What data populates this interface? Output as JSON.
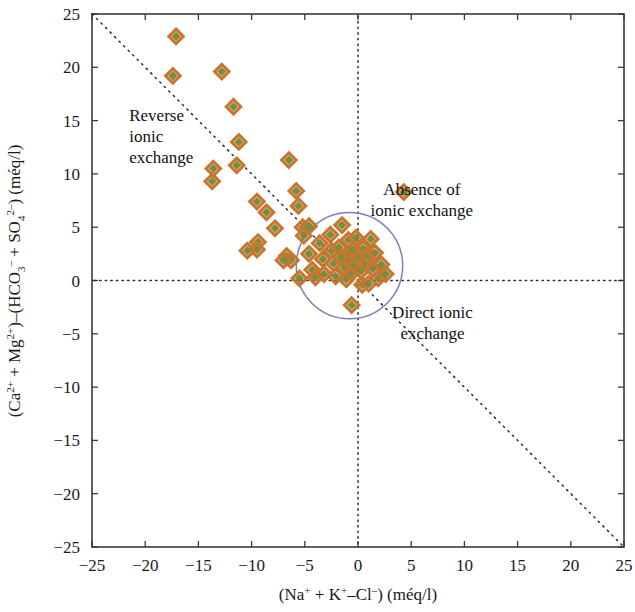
{
  "chart_data": {
    "type": "scatter",
    "title": "",
    "xlabel": "(Na+ + K+–Cl–) (méq/l)",
    "ylabel": "(Ca2+ + Mg2+)–(HCO3– + SO42–) (méq/l)",
    "xlim": [
      -25,
      25
    ],
    "ylim": [
      -25,
      25
    ],
    "xticks": [
      -25,
      -20,
      -15,
      -10,
      -5,
      0,
      5,
      10,
      15,
      20,
      25
    ],
    "yticks": [
      -25,
      -20,
      -15,
      -10,
      -5,
      0,
      5,
      10,
      15,
      20,
      25
    ],
    "xtick_labels": [
      "−25",
      "−20",
      "−15",
      "−10",
      "−5",
      "0",
      "5",
      "10",
      "15",
      "20",
      "25"
    ],
    "ytick_labels": [
      "−25",
      "−20",
      "−15",
      "−10",
      "−5",
      "0",
      "5",
      "10",
      "15",
      "20",
      "25"
    ],
    "grid": false,
    "legend": "none",
    "marker": "diamond",
    "marker_fill_color": "#7d8c3c",
    "marker_edge_color": "#c8762f",
    "reference_lines": [
      {
        "name": "horizontal-zero-line",
        "type": "horizontal",
        "value": 0,
        "style": "dotted"
      },
      {
        "name": "vertical-zero-line",
        "type": "vertical",
        "value": 0,
        "style": "dotted"
      },
      {
        "name": "one-to-one-negative-slope-line",
        "type": "diagonal",
        "slope": -1,
        "intercept": 0,
        "style": "dotted",
        "from": [
          -25,
          25
        ],
        "to": [
          25,
          -25
        ]
      }
    ],
    "regions": [
      {
        "name": "absence-of-ionic-exchange-circle",
        "type": "circle",
        "center": [
          -0.8,
          1.4
        ],
        "radius": 5.0,
        "stroke": "#7b7fb5"
      }
    ],
    "annotations": [
      {
        "name": "reverse-ionic-exchange-label",
        "lines": [
          "Reverse",
          "ionic",
          "exchange"
        ],
        "x": -21.5,
        "y": 15.0
      },
      {
        "name": "absence-of-ionic-exchange-label",
        "lines": [
          "Absence of",
          "ionic exchange"
        ],
        "x": 6.0,
        "y": 8.0
      },
      {
        "name": "direct-ionic-exchange-label",
        "lines": [
          "Direct ionic",
          "exchange"
        ],
        "x": 7.0,
        "y": -3.5
      }
    ],
    "points": [
      [
        -17.1,
        22.9
      ],
      [
        -17.4,
        19.2
      ],
      [
        -12.8,
        19.6
      ],
      [
        -11.7,
        16.3
      ],
      [
        -11.2,
        13.0
      ],
      [
        -13.6,
        10.5
      ],
      [
        -13.7,
        9.3
      ],
      [
        -11.4,
        10.8
      ],
      [
        -9.5,
        7.4
      ],
      [
        -8.6,
        6.4
      ],
      [
        -7.8,
        4.9
      ],
      [
        -9.4,
        3.6
      ],
      [
        -9.5,
        2.9
      ],
      [
        -6.5,
        11.3
      ],
      [
        -5.8,
        8.4
      ],
      [
        -5.6,
        7.0
      ],
      [
        -5.2,
        5.0
      ],
      [
        -5.1,
        4.2
      ],
      [
        -6.7,
        2.3
      ],
      [
        -6.3,
        1.9
      ],
      [
        -5.5,
        0.2
      ],
      [
        -4.6,
        2.5
      ],
      [
        -4.3,
        1.0
      ],
      [
        -4.0,
        0.3
      ],
      [
        -3.6,
        3.5
      ],
      [
        -3.3,
        2.0
      ],
      [
        -3.2,
        0.6
      ],
      [
        -2.6,
        4.3
      ],
      [
        -2.5,
        2.8
      ],
      [
        -2.3,
        1.6
      ],
      [
        -2.1,
        0.4
      ],
      [
        -1.8,
        3.1
      ],
      [
        -1.6,
        2.2
      ],
      [
        -1.5,
        5.2
      ],
      [
        -1.3,
        1.2
      ],
      [
        -1.1,
        0.1
      ],
      [
        -0.9,
        3.8
      ],
      [
        -0.8,
        2.6
      ],
      [
        -0.7,
        1.8
      ],
      [
        -0.6,
        0.7
      ],
      [
        -0.4,
        2.9
      ],
      [
        -0.3,
        1.4
      ],
      [
        -0.2,
        4.0
      ],
      [
        0.1,
        2.2
      ],
      [
        0.3,
        0.9
      ],
      [
        0.5,
        3.0
      ],
      [
        0.7,
        1.7
      ],
      [
        0.9,
        2.4
      ],
      [
        1.2,
        3.9
      ],
      [
        1.4,
        1.1
      ],
      [
        1.6,
        2.6
      ],
      [
        1.9,
        0.2
      ],
      [
        2.2,
        1.5
      ],
      [
        2.6,
        0.6
      ],
      [
        0.4,
        -0.4
      ],
      [
        1.0,
        -0.3
      ],
      [
        -0.6,
        -2.3
      ],
      [
        4.3,
        8.3
      ],
      [
        -4.6,
        5.1
      ],
      [
        -7.0,
        1.9
      ],
      [
        -10.4,
        2.8
      ]
    ]
  }
}
